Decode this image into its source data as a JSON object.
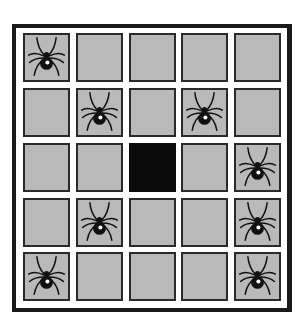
{
  "board": {
    "rows": 5,
    "cols": 5,
    "colors": {
      "frame": "#1a1a1a",
      "cell": "#b9b9b9",
      "cell_border": "#2a2a2a",
      "black_cell": "#0b0b0b",
      "spider": "#111111"
    },
    "cells": [
      [
        "spider",
        "empty",
        "empty",
        "empty",
        "empty"
      ],
      [
        "empty",
        "spider",
        "empty",
        "spider",
        "empty"
      ],
      [
        "empty",
        "empty",
        "black",
        "empty",
        "spider"
      ],
      [
        "empty",
        "spider",
        "empty",
        "empty",
        "spider"
      ],
      [
        "spider",
        "empty",
        "empty",
        "empty",
        "spider"
      ]
    ]
  }
}
